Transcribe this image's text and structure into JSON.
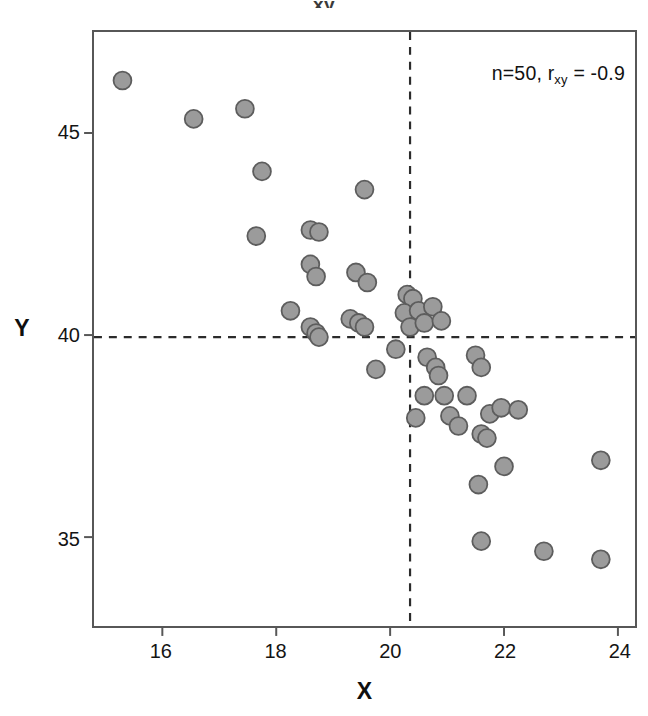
{
  "figure": {
    "cut_title_text": "xy",
    "annotation_prefix": "n=50, r",
    "annotation_subscript": "xy",
    "annotation_suffix": " = -0.9",
    "marker_fill": "#9b9b9b",
    "marker_stroke": "#5d5d5d",
    "frame_color": "#575757",
    "guide_color": "#2b2b2b"
  },
  "chart_data": {
    "type": "scatter",
    "title": "",
    "xlabel": "X",
    "ylabel": "Y",
    "n": 50,
    "correlation": -0.9,
    "annotation": "n=50, r_xy = -0.9",
    "xlim": [
      14.8,
      24.3
    ],
    "ylim": [
      32.8,
      47.5
    ],
    "xticks": [
      16,
      18,
      20,
      22,
      24
    ],
    "yticks": [
      35,
      40,
      45
    ],
    "xtick_labels": [
      "16",
      "18",
      "20",
      "22",
      "24"
    ],
    "ytick_labels": [
      "35",
      "40",
      "45"
    ],
    "grid": false,
    "legend": null,
    "reference_lines": [
      {
        "orientation": "vertical",
        "value": 20.35,
        "style": "dashed"
      },
      {
        "orientation": "horizontal",
        "value": 39.95,
        "style": "dashed"
      }
    ],
    "marker": {
      "shape": "circle",
      "size_px": 18
    },
    "points": [
      {
        "x": 15.3,
        "y": 46.3
      },
      {
        "x": 16.55,
        "y": 45.35
      },
      {
        "x": 17.45,
        "y": 45.6
      },
      {
        "x": 17.75,
        "y": 44.05
      },
      {
        "x": 17.65,
        "y": 42.45
      },
      {
        "x": 18.6,
        "y": 42.6
      },
      {
        "x": 18.75,
        "y": 42.55
      },
      {
        "x": 19.55,
        "y": 43.6
      },
      {
        "x": 18.6,
        "y": 41.75
      },
      {
        "x": 18.7,
        "y": 41.45
      },
      {
        "x": 19.4,
        "y": 41.55
      },
      {
        "x": 19.6,
        "y": 41.3
      },
      {
        "x": 18.25,
        "y": 40.6
      },
      {
        "x": 18.6,
        "y": 40.2
      },
      {
        "x": 18.7,
        "y": 40.05
      },
      {
        "x": 18.75,
        "y": 39.95
      },
      {
        "x": 19.3,
        "y": 40.4
      },
      {
        "x": 19.45,
        "y": 40.3
      },
      {
        "x": 19.55,
        "y": 40.2
      },
      {
        "x": 20.3,
        "y": 41.0
      },
      {
        "x": 20.4,
        "y": 40.9
      },
      {
        "x": 20.25,
        "y": 40.55
      },
      {
        "x": 20.5,
        "y": 40.6
      },
      {
        "x": 20.75,
        "y": 40.7
      },
      {
        "x": 20.35,
        "y": 40.2
      },
      {
        "x": 20.6,
        "y": 40.3
      },
      {
        "x": 20.9,
        "y": 40.35
      },
      {
        "x": 20.1,
        "y": 39.65
      },
      {
        "x": 19.75,
        "y": 39.15
      },
      {
        "x": 20.65,
        "y": 39.45
      },
      {
        "x": 20.8,
        "y": 39.2
      },
      {
        "x": 20.85,
        "y": 39.0
      },
      {
        "x": 21.5,
        "y": 39.5
      },
      {
        "x": 21.6,
        "y": 39.2
      },
      {
        "x": 20.6,
        "y": 38.5
      },
      {
        "x": 20.95,
        "y": 38.5
      },
      {
        "x": 21.35,
        "y": 38.5
      },
      {
        "x": 20.45,
        "y": 37.95
      },
      {
        "x": 21.05,
        "y": 38.0
      },
      {
        "x": 21.2,
        "y": 37.75
      },
      {
        "x": 21.75,
        "y": 38.05
      },
      {
        "x": 21.95,
        "y": 38.2
      },
      {
        "x": 22.25,
        "y": 38.15
      },
      {
        "x": 21.6,
        "y": 37.55
      },
      {
        "x": 21.7,
        "y": 37.45
      },
      {
        "x": 21.55,
        "y": 36.3
      },
      {
        "x": 22.0,
        "y": 36.75
      },
      {
        "x": 23.7,
        "y": 36.9
      },
      {
        "x": 21.6,
        "y": 34.9
      },
      {
        "x": 22.7,
        "y": 34.65
      },
      {
        "x": 23.7,
        "y": 34.45
      }
    ]
  }
}
